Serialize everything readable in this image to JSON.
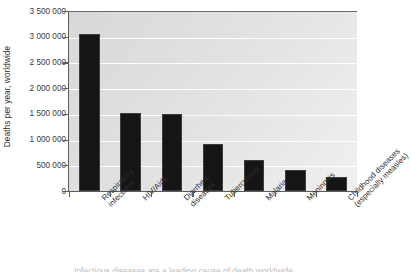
{
  "chart_data": {
    "type": "bar",
    "title": "",
    "xlabel": "",
    "ylabel": "Deaths per year, worldwide",
    "ylim": [
      0,
      3500000
    ],
    "ytick_step": 500000,
    "grid": true,
    "legend": null,
    "categories": [
      "Respiratory infections",
      "HIV/Aids",
      "Diarrheal diseases",
      "Tuberculosis",
      "Malaria",
      "Meningitis",
      "Childhood diseases (especially measles)"
    ],
    "category_lines": [
      [
        "Respiratory",
        "infections"
      ],
      [
        "HIV/Aids",
        ""
      ],
      [
        "Diarrheal",
        "diseases"
      ],
      [
        "Tuberculosis",
        ""
      ],
      [
        "Malaria",
        ""
      ],
      [
        "Meningitis",
        ""
      ],
      [
        "Childhood diseases",
        "(especially measles)"
      ]
    ],
    "values": [
      3060000,
      1520000,
      1500000,
      920000,
      610000,
      400000,
      280000
    ],
    "ytick_labels": [
      "3 500 000",
      "3 000 000",
      "2 500 000",
      "2 000 000",
      "1 500 000",
      "1 000 000",
      "500 000",
      "0"
    ],
    "ytick_values": [
      3500000,
      3000000,
      2500000,
      2000000,
      1500000,
      1000000,
      500000,
      0
    ],
    "colors": {
      "bar": "#151515",
      "plot_background": "#d8d8d8",
      "gridline": "#ffffff",
      "axis": "#5d5d5d",
      "text": "#2e2e2e"
    }
  },
  "bottom_caption": {
    "text": "Infectious diseases are a leading cause of death worldwide"
  }
}
